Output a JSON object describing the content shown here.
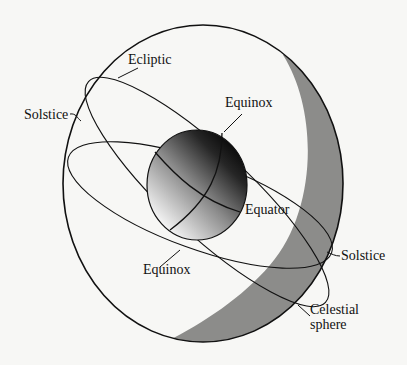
{
  "diagram": {
    "type": "celestial-sphere",
    "colors": {
      "background": "#f7f7f5",
      "line": "#111111",
      "crescent_shade": "#8a8a88",
      "earth_dark": "#0d0d0d",
      "earth_light": "#f2f2f2"
    },
    "labels": {
      "ecliptic": "Ecliptic",
      "solstice_left": "Solstice",
      "equinox_top": "Equinox",
      "equator": "Equator",
      "equinox_bottom": "Equinox",
      "solstice_right": "Solstice",
      "celestial_line1": "Celestial",
      "celestial_line2": "sphere"
    }
  }
}
